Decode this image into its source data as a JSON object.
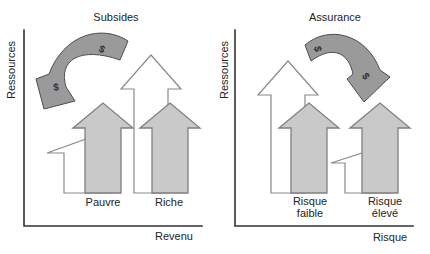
{
  "figure": {
    "currency_symbol": "$",
    "left_panel": {
      "title": "Subsides",
      "y_axis_label": "Ressources",
      "x_axis_label": "Revenu",
      "categories": [
        "Pauvre",
        "Riche"
      ],
      "transfer": {
        "from": "Riche",
        "to": "Pauvre"
      }
    },
    "right_panel": {
      "title": "Assurance",
      "y_axis_label": "Ressources",
      "x_axis_label": "Risque",
      "categories": [
        "Risque faible",
        "Risque élevé"
      ],
      "transfer": {
        "from": "Risque faible",
        "to": "Risque élevé"
      }
    },
    "colors": {
      "after_arrow_fill": "#c9c9c9",
      "before_arrow_fill": "#ffffff",
      "transfer_arrow_fill": "#9a9a9a",
      "axis_color": "#333333",
      "text_color": "#242424",
      "background": "#ffffff"
    }
  }
}
